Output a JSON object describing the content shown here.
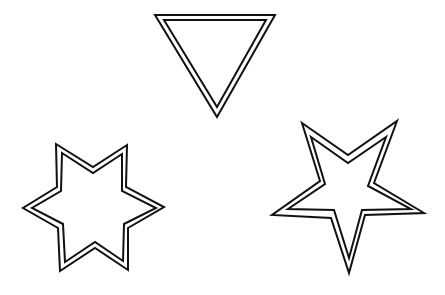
{
  "figure": {
    "background": "#ffffff",
    "stroke_color": "#111111",
    "shapes": [
      {
        "name": "inverted-triangle",
        "type": "triangle",
        "style": "double-outline"
      },
      {
        "name": "six-pointed-star",
        "type": "hexagram",
        "style": "double-outline"
      },
      {
        "name": "five-pointed-star",
        "type": "pentagram",
        "style": "double-outline"
      }
    ]
  }
}
